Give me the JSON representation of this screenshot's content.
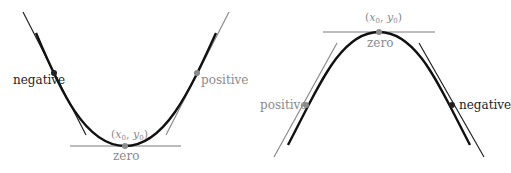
{
  "colors": {
    "curve": "#111111",
    "negative": "#222222",
    "positive": "#8a8a8a",
    "zero": "#8a8a8a",
    "tangent_zero": "#7a7a7a",
    "background": "#ffffff"
  },
  "left_panel": {
    "shape": "convex parabola (opens upward)",
    "negative_label": "negative",
    "positive_label": "positive",
    "zero_label": "zero",
    "point_label_x": "x",
    "point_label_sub_x": "0",
    "point_label_y": "y",
    "point_label_sub_y": "0",
    "point_label_open": "(",
    "point_label_comma": ", ",
    "point_label_close": ")"
  },
  "right_panel": {
    "shape": "concave parabola (opens downward)",
    "negative_label": "negative",
    "positive_label": "positive",
    "zero_label": "zero",
    "point_label_x": "x",
    "point_label_sub_x": "0",
    "point_label_y": "y",
    "point_label_sub_y": "0",
    "point_label_open": "(",
    "point_label_comma": ", ",
    "point_label_close": ")"
  }
}
